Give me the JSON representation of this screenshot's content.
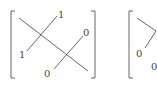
{
  "diagram": {
    "matrix_1": {
      "labels": {
        "top_right_upper": "1",
        "left_lower": "1",
        "right_upper": "0",
        "bottom": "0"
      }
    },
    "matrix_2": {
      "labels": {
        "left": "0",
        "bottom_right": "0"
      }
    }
  },
  "colors": {
    "stroke": "#555555",
    "text": "#444444"
  }
}
